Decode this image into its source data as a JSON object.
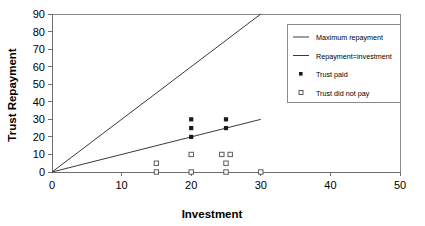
{
  "chart_data": {
    "type": "scatter",
    "title": "",
    "xlabel": "Investment",
    "ylabel": "Trust Repayment",
    "xlim": [
      0,
      50
    ],
    "ylim": [
      0,
      90
    ],
    "xticks": [
      0,
      10,
      20,
      30,
      40,
      50
    ],
    "yticks": [
      0,
      10,
      20,
      30,
      40,
      50,
      60,
      70,
      80,
      90
    ],
    "grid": false,
    "legend_position": "upper-right",
    "legend_entries": [
      {
        "label": "Maximum repayment",
        "marker": "line"
      },
      {
        "label": "Repayment=investment",
        "marker": "line"
      },
      {
        "label": "Trust paid",
        "marker": "filled-square"
      },
      {
        "label": "Trust did not pay",
        "marker": "open-square"
      }
    ],
    "series": [
      {
        "name": "Maximum repayment",
        "type": "line",
        "marker": "line",
        "x": [
          0,
          30
        ],
        "y": [
          0,
          90
        ]
      },
      {
        "name": "Repayment=investment",
        "type": "line",
        "marker": "line",
        "x": [
          0,
          30
        ],
        "y": [
          0,
          30
        ]
      },
      {
        "name": "Trust paid",
        "type": "scatter",
        "marker": "filled-square",
        "points": [
          {
            "x": 20,
            "y": 30
          },
          {
            "x": 20,
            "y": 25
          },
          {
            "x": 20,
            "y": 20
          },
          {
            "x": 25,
            "y": 30
          },
          {
            "x": 25,
            "y": 25
          }
        ]
      },
      {
        "name": "Trust did not pay",
        "type": "scatter",
        "marker": "open-square",
        "points": [
          {
            "x": 15,
            "y": 5
          },
          {
            "x": 15,
            "y": 0
          },
          {
            "x": 20,
            "y": 10
          },
          {
            "x": 20,
            "y": 0
          },
          {
            "x": 24.4,
            "y": 10
          },
          {
            "x": 25.6,
            "y": 10
          },
          {
            "x": 25,
            "y": 5
          },
          {
            "x": 25,
            "y": 0
          },
          {
            "x": 30,
            "y": 0
          }
        ]
      }
    ]
  }
}
